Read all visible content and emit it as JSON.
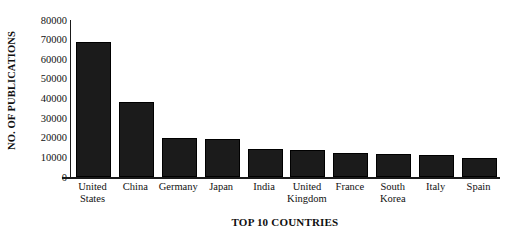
{
  "chart_data": {
    "type": "bar",
    "title": "",
    "xlabel": "TOP 10 COUNTRIES",
    "ylabel": "NO. OF PUBLICATIONS",
    "categories": [
      "United States",
      "China",
      "Germany",
      "Japan",
      "India",
      "United Kingdom",
      "France",
      "South Korea",
      "Italy",
      "Spain"
    ],
    "category_lines": [
      [
        "United",
        "States"
      ],
      [
        "China"
      ],
      [
        "Germany"
      ],
      [
        "Japan"
      ],
      [
        "India"
      ],
      [
        "United",
        "Kingdom"
      ],
      [
        "France"
      ],
      [
        "South",
        "Korea"
      ],
      [
        "Italy"
      ],
      [
        "Spain"
      ]
    ],
    "values": [
      69000,
      38000,
      20000,
      19500,
      14500,
      14000,
      12000,
      11500,
      11000,
      9800
    ],
    "ylim": [
      0,
      80000
    ],
    "ytick_labels": [
      "80000",
      "70000",
      "60000",
      "50000",
      "40000",
      "30000",
      "20000",
      "10000",
      "0"
    ],
    "ytick_values": [
      80000,
      70000,
      60000,
      50000,
      40000,
      30000,
      20000,
      10000,
      0
    ],
    "grid": false,
    "legend": false,
    "bar_color": "#1b1b1b",
    "axis_color": "#1a1a1a",
    "text_color": "#111111",
    "background": "#ffffff"
  }
}
